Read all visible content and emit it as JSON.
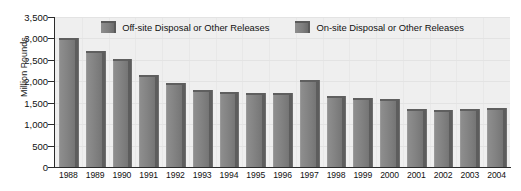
{
  "chart_data": {
    "type": "bar",
    "title": "",
    "xlabel": "",
    "ylabel": "Million Pounds",
    "ylim": [
      0,
      3500
    ],
    "ytick_step": 500,
    "grid": true,
    "legend_position": "top-center",
    "categories": [
      "1988",
      "1989",
      "1990",
      "1991",
      "1992",
      "1993",
      "1994",
      "1995",
      "1996",
      "1997",
      "1998",
      "1999",
      "2000",
      "2001",
      "2002",
      "2003",
      "2004"
    ],
    "ytick_labels": [
      "3,500",
      "3,000",
      "2,500",
      "2,000",
      "1,500",
      "1,000",
      "500",
      "0"
    ],
    "series": [
      {
        "name": "Off-site Disposal or Other Releases",
        "color": "#7b7b7b",
        "values": [
          3000,
          2700,
          2530,
          2150,
          1950,
          1800,
          1750,
          1720,
          1720,
          2030,
          1650,
          1620,
          1580,
          1350,
          1330,
          1360,
          1370
        ]
      },
      {
        "name": "On-site Disposal or Other Releases",
        "color": "#6d6d6d",
        "values": [
          3000,
          2700,
          2530,
          2150,
          1950,
          1800,
          1750,
          1720,
          1720,
          2030,
          1650,
          1620,
          1580,
          1350,
          1330,
          1360,
          1370
        ]
      }
    ],
    "values": [
      3000,
      2700,
      2530,
      2150,
      1950,
      1800,
      1750,
      1720,
      1720,
      2030,
      1650,
      1620,
      1580,
      1350,
      1330,
      1360,
      1370
    ]
  },
  "legend": {
    "items": [
      {
        "label": "Off-site Disposal or Other Releases",
        "swatch": "legend-swatch-offsite"
      },
      {
        "label": "On-site Disposal or Other Releases",
        "swatch": "legend-swatch-onsite"
      }
    ]
  },
  "colors": {
    "plot_background": "#efefef",
    "gridline": "#e3e3e3",
    "axis": "#2b2b2b",
    "bar_fill": "#7b7b7b",
    "bar_shadow": "#5d5d5d",
    "text": "#111111"
  }
}
